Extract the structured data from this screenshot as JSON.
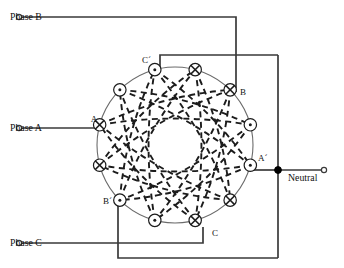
{
  "diagram": {
    "type": "electrical-winding-schematic",
    "colors": {
      "wire": "#3a3a3a",
      "stator": "#6b6b6b",
      "coil_dash": "#1c1c1c",
      "text": "#111111",
      "background": "#ffffff"
    }
  },
  "terminals": [
    {
      "id": "phase-b",
      "label": "Phase B",
      "x": 10,
      "y": 17,
      "marker": "open-circle"
    },
    {
      "id": "phase-a",
      "label": "Phase A",
      "x": 10,
      "y": 128,
      "marker": "open-circle"
    },
    {
      "id": "phase-c",
      "label": "Phase C",
      "x": 10,
      "y": 243,
      "marker": "open-circle"
    },
    {
      "id": "neutral",
      "label": "Neutral",
      "x": 288,
      "y": 178,
      "marker": "open-circle"
    }
  ],
  "node_labels": [
    {
      "id": "node-a",
      "label": "A",
      "x": 97,
      "y": 122
    },
    {
      "id": "node-b",
      "label": "B",
      "x": 238,
      "y": 92
    },
    {
      "id": "node-c",
      "label": "C",
      "x": 210,
      "y": 233
    },
    {
      "id": "node-a-prime",
      "label": "A´",
      "x": 259,
      "y": 160
    },
    {
      "id": "node-b-prime",
      "label": "B´",
      "x": 108,
      "y": 202
    },
    {
      "id": "node-c-prime",
      "label": "C´",
      "x": 148,
      "y": 62
    }
  ],
  "stator": {
    "center_x": 175,
    "center_y": 145,
    "radius": 78,
    "slot_count": 12
  },
  "slots": [
    {
      "index": 0,
      "name": "slot-c-prime",
      "symbol": "dot",
      "label": "C´",
      "angle_deg": -105
    },
    {
      "index": 1,
      "name": "slot-1",
      "symbol": "cross",
      "label": "",
      "angle_deg": -75
    },
    {
      "index": 2,
      "name": "slot-b",
      "symbol": "cross",
      "label": "B",
      "angle_deg": -45
    },
    {
      "index": 3,
      "name": "slot-3",
      "symbol": "dot",
      "label": "",
      "angle_deg": -15
    },
    {
      "index": 4,
      "name": "slot-a-prime",
      "symbol": "dot",
      "label": "A´",
      "angle_deg": 15
    },
    {
      "index": 5,
      "name": "slot-5",
      "symbol": "cross",
      "label": "",
      "angle_deg": 45
    },
    {
      "index": 6,
      "name": "slot-c",
      "symbol": "cross",
      "label": "C",
      "angle_deg": 75
    },
    {
      "index": 7,
      "name": "slot-7",
      "symbol": "dot",
      "label": "",
      "angle_deg": 105
    },
    {
      "index": 8,
      "name": "slot-b-prime",
      "symbol": "dot",
      "label": "B´",
      "angle_deg": 135
    },
    {
      "index": 9,
      "name": "slot-9",
      "symbol": "cross",
      "label": "",
      "angle_deg": 165
    },
    {
      "index": 10,
      "name": "slot-a",
      "symbol": "cross",
      "label": "A",
      "angle_deg": 195
    },
    {
      "index": 11,
      "name": "slot-11",
      "symbol": "dot",
      "label": "",
      "angle_deg": 225
    }
  ],
  "coil_chords": [
    {
      "from": 0,
      "to": 5
    },
    {
      "from": 5,
      "to": 10
    },
    {
      "from": 10,
      "to": 3
    },
    {
      "from": 3,
      "to": 8
    },
    {
      "from": 8,
      "to": 1
    },
    {
      "from": 1,
      "to": 6
    },
    {
      "from": 6,
      "to": 11
    },
    {
      "from": 11,
      "to": 4
    },
    {
      "from": 4,
      "to": 9
    },
    {
      "from": 9,
      "to": 2
    },
    {
      "from": 2,
      "to": 7
    },
    {
      "from": 7,
      "to": 0
    },
    {
      "from": 0,
      "to": 4
    },
    {
      "from": 4,
      "to": 8
    },
    {
      "from": 8,
      "to": 0
    },
    {
      "from": 2,
      "to": 6
    },
    {
      "from": 6,
      "to": 10
    },
    {
      "from": 10,
      "to": 2
    },
    {
      "from": 1,
      "to": 5
    },
    {
      "from": 5,
      "to": 9
    },
    {
      "from": 9,
      "to": 1
    },
    {
      "from": 3,
      "to": 7
    },
    {
      "from": 7,
      "to": 11
    },
    {
      "from": 11,
      "to": 3
    }
  ]
}
